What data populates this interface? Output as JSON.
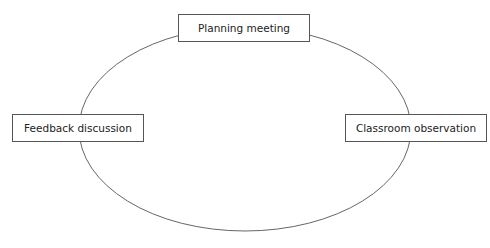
{
  "diagram": {
    "type": "cycle",
    "nodes": [
      {
        "id": "planning",
        "label": "Planning meeting",
        "position": "top"
      },
      {
        "id": "observation",
        "label": "Classroom observation",
        "position": "right"
      },
      {
        "id": "feedback",
        "label": "Feedback discussion",
        "position": "left"
      }
    ],
    "edges": [
      {
        "from": "planning",
        "to": "observation"
      },
      {
        "from": "observation",
        "to": "feedback"
      },
      {
        "from": "feedback",
        "to": "planning"
      }
    ],
    "colors": {
      "line": "#555555",
      "text": "#222222",
      "background": "#ffffff"
    }
  }
}
